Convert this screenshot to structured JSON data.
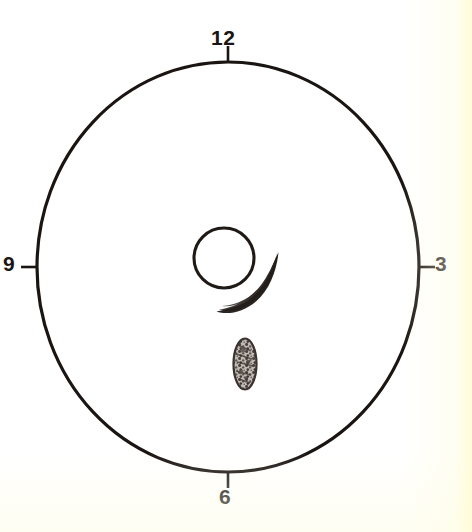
{
  "figure": {
    "background_color": "#ffffff",
    "ink_color": "#1a1512",
    "width": 472,
    "height": 532
  },
  "clock": {
    "outer_circle": {
      "name": "outer-boundary-circle",
      "center_x": 228,
      "center_y": 267,
      "radius_x": 191,
      "radius_y": 205,
      "stroke_width": 3.2,
      "fill": "none"
    },
    "hour_marks": [
      {
        "label": "12",
        "position": "top",
        "angle_deg": 90,
        "tick_length": 16
      },
      {
        "label": "3",
        "position": "right",
        "angle_deg": 0,
        "tick_length": 16
      },
      {
        "label": "6",
        "position": "bottom",
        "angle_deg": 270,
        "tick_length": 16
      },
      {
        "label": "9",
        "position": "left",
        "angle_deg": 180,
        "tick_length": 16
      }
    ]
  },
  "markings": {
    "inner_circle": {
      "name": "inner-outline-circle",
      "center_x": 224,
      "center_y": 258,
      "radius": 30,
      "stroke_width": 3,
      "fill": "none"
    },
    "crescent": {
      "name": "filled-crescent-mark",
      "description": "thick dark comma-shaped crescent sweeping around the lower-right of the inner circle",
      "fill": "#2b2522",
      "tip_start_x": 216,
      "tip_start_y": 311,
      "tip_end_x": 278,
      "tip_end_y": 250
    },
    "oval": {
      "name": "mottled-oval-mark",
      "description": "small elongated vertical lens-shaped mark with speckled interior texture",
      "center_x": 245,
      "center_y": 364,
      "radius_x": 12,
      "radius_y": 26,
      "stroke": "#3a3330",
      "stroke_width": 2.2,
      "fill": "#b9b2ac"
    }
  }
}
